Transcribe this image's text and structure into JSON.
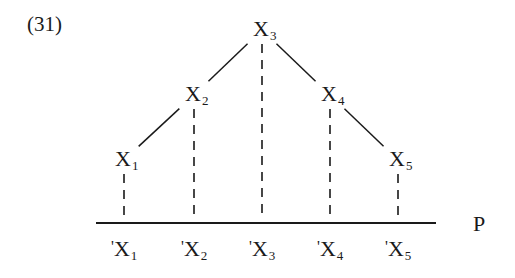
{
  "example_number": "(31)",
  "projection_label": "P",
  "nodes": [
    {
      "id": "x3",
      "base": "X",
      "sub": "3",
      "level": 0
    },
    {
      "id": "x2",
      "base": "X",
      "sub": "2",
      "level": 1
    },
    {
      "id": "x4",
      "base": "X",
      "sub": "4",
      "level": 1
    },
    {
      "id": "x1",
      "base": "X",
      "sub": "1",
      "level": 2
    },
    {
      "id": "x5",
      "base": "X",
      "sub": "5",
      "level": 2
    }
  ],
  "tree_edges": [
    {
      "from": "x3",
      "to": "x2"
    },
    {
      "from": "x3",
      "to": "x4"
    },
    {
      "from": "x2",
      "to": "x1"
    },
    {
      "from": "x4",
      "to": "x5"
    }
  ],
  "projections": [
    {
      "node": "x1",
      "prime": "'",
      "base": "X",
      "sub": "1"
    },
    {
      "node": "x2",
      "prime": "'",
      "base": "X",
      "sub": "2"
    },
    {
      "node": "x3",
      "prime": "'",
      "base": "X",
      "sub": "3"
    },
    {
      "node": "x4",
      "prime": "'",
      "base": "X",
      "sub": "4"
    },
    {
      "node": "x5",
      "prime": "'",
      "base": "X",
      "sub": "5"
    }
  ],
  "colors": {
    "ink": "#1a1a1a",
    "background": "#ffffff"
  }
}
